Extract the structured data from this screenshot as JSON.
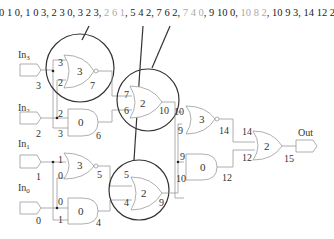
{
  "sequence": {
    "items": [
      {
        "text": "0 1 0",
        "color": "#222222",
        "highlighted": true
      },
      {
        "text": "1 0 3",
        "color": "#222222",
        "highlighted": true
      },
      {
        "text": "2 3 0",
        "color": "#222222",
        "highlighted": true
      },
      {
        "text": "3 2 3",
        "color": "#222222",
        "highlighted": true
      },
      {
        "text": "2 6 1",
        "color": "#aaaaaa",
        "highlighted": false
      },
      {
        "text": "5 4 2",
        "color": "#222222",
        "highlighted": true
      },
      {
        "text": "7 6 2",
        "color": "#222222",
        "highlighted": true
      },
      {
        "text": "7 4 0",
        "color": "#aaaaaa",
        "highlighted": false
      },
      {
        "text": "9 10 0",
        "color": "#222222",
        "highlighted": true
      },
      {
        "text": "10 8 2",
        "color": "#aaaaaa",
        "highlighted": false
      },
      {
        "text": "10 9 3",
        "color": "#222222",
        "highlighted": true
      },
      {
        "text": "14 12 2",
        "color": "#222222",
        "highlighted": true
      }
    ]
  },
  "inputs": [
    {
      "name": "In",
      "sub": "3",
      "value": "3"
    },
    {
      "name": "In",
      "sub": "2",
      "value": "2"
    },
    {
      "name": "In",
      "sub": "1",
      "value": "1"
    },
    {
      "name": "In",
      "sub": "0",
      "value": "0"
    }
  ],
  "gates": [
    {
      "id": "g7",
      "type": "nor",
      "op": "3",
      "in_a": "3",
      "in_b": "2",
      "out": "7",
      "circled": true
    },
    {
      "id": "g6",
      "type": "and",
      "op": "0",
      "in_a": "2",
      "in_b": "3",
      "out": "6",
      "circled": false
    },
    {
      "id": "g5",
      "type": "nor",
      "op": "3",
      "in_a": "1",
      "in_b": "0",
      "out": "5",
      "circled": false
    },
    {
      "id": "g4",
      "type": "and",
      "op": "0",
      "in_a": "0",
      "in_b": "1",
      "out": "4",
      "circled": false
    },
    {
      "id": "g10",
      "type": "or",
      "op": "2",
      "in_a": "7",
      "in_b": "6",
      "out": "10",
      "circled": true
    },
    {
      "id": "g9",
      "type": "or",
      "op": "2",
      "in_a": "5",
      "in_b": "4",
      "out": "9",
      "circled": true
    },
    {
      "id": "g14",
      "type": "nor",
      "op": "3",
      "in_a": "10",
      "in_b": "9",
      "out": "14",
      "circled": false
    },
    {
      "id": "g12",
      "type": "and",
      "op": "0",
      "in_a": "9",
      "in_b": "10",
      "out": "12",
      "circled": false
    },
    {
      "id": "g15",
      "type": "or",
      "op": "2",
      "in_a": "14",
      "in_b": "12",
      "out": "15",
      "circled": false
    }
  ],
  "output": {
    "name": "Out"
  }
}
